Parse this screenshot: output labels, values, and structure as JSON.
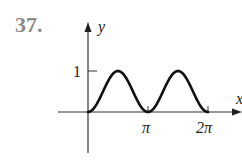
{
  "problem_number": "37.",
  "chart_data": {
    "type": "line",
    "title": "",
    "function": "y = sin^2(x)",
    "xlabel": "x",
    "ylabel": "y",
    "x_ticks": [
      "π",
      "2π"
    ],
    "x_tick_values": [
      3.14159,
      6.28319
    ],
    "y_ticks": [
      "1"
    ],
    "y_tick_values": [
      1
    ],
    "xlim": [
      0,
      6.28319
    ],
    "ylim": [
      0,
      1
    ],
    "grid": false,
    "series": [
      {
        "name": "curve",
        "x": [
          0,
          0.785,
          1.571,
          2.356,
          3.142,
          3.927,
          4.712,
          5.498,
          6.283
        ],
        "y": [
          0,
          0.5,
          1,
          0.5,
          0,
          0.5,
          1,
          0.5,
          0
        ]
      }
    ]
  }
}
